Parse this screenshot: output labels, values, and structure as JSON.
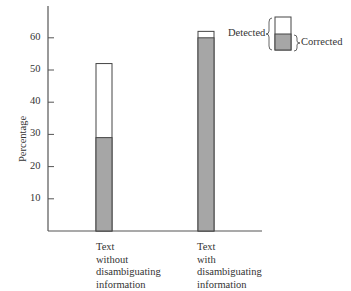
{
  "chart_data": {
    "type": "bar",
    "stacked": true,
    "title": "",
    "xlabel": "",
    "ylabel": "Percentage",
    "ylim": [
      0,
      70
    ],
    "yticks": [
      10,
      20,
      30,
      40,
      50,
      60
    ],
    "grid": false,
    "categories": [
      "Text without disambiguating information",
      "Text with disambiguating information"
    ],
    "category_lines": [
      [
        "Text",
        "without",
        "disambiguating",
        "information"
      ],
      [
        "Text",
        "with",
        "disambiguating",
        "information"
      ]
    ],
    "series": [
      {
        "name": "Corrected",
        "values": [
          29,
          60
        ],
        "color": "#a6a6a6"
      },
      {
        "name": "Detected",
        "values": [
          52,
          62
        ],
        "color": "#ffffff",
        "note": "total height of bar (includes corrected)"
      }
    ],
    "legend": {
      "position": "top-right",
      "entries": [
        "Detected",
        "Corrected"
      ]
    }
  },
  "labels": {
    "ylabel": "Percentage",
    "legend_detected": "Detected",
    "legend_corrected": "Corrected",
    "cat1": [
      "Text",
      "without",
      "disambiguating",
      "information"
    ],
    "cat2": [
      "Text",
      "with",
      "disambiguating",
      "information"
    ],
    "ticks": [
      "10",
      "20",
      "30",
      "40",
      "50",
      "60"
    ]
  }
}
